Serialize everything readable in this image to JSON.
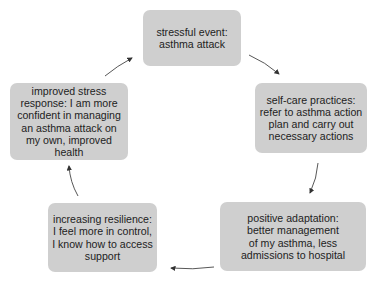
{
  "diagram": {
    "type": "cycle",
    "nodes": [
      {
        "id": "stressful-event",
        "lines": [
          "stressful event:",
          "asthma attack"
        ]
      },
      {
        "id": "self-care",
        "lines": [
          "self-care practices:",
          "refer to asthma action",
          "plan and carry out",
          "necessary actions"
        ]
      },
      {
        "id": "positive-adaptation",
        "lines": [
          "positive adaptation:",
          "better management",
          "of my asthma, less",
          "admissions to hospital"
        ]
      },
      {
        "id": "increasing-resilience",
        "lines": [
          "increasing resilience:",
          "I feel more in control,",
          "I know how to access",
          "support"
        ]
      },
      {
        "id": "improved-stress-response",
        "lines": [
          "improved stress",
          "response: I am more",
          "confident in managing",
          "an asthma attack on",
          "my own, improved",
          "health"
        ]
      }
    ],
    "edges": [
      {
        "from": "stressful-event",
        "to": "self-care"
      },
      {
        "from": "self-care",
        "to": "positive-adaptation"
      },
      {
        "from": "positive-adaptation",
        "to": "increasing-resilience"
      },
      {
        "from": "increasing-resilience",
        "to": "improved-stress-response"
      },
      {
        "from": "improved-stress-response",
        "to": "stressful-event"
      }
    ],
    "colors": {
      "node_fill": "#cfcfcf",
      "text": "#222222",
      "arrow": "#333333"
    }
  }
}
